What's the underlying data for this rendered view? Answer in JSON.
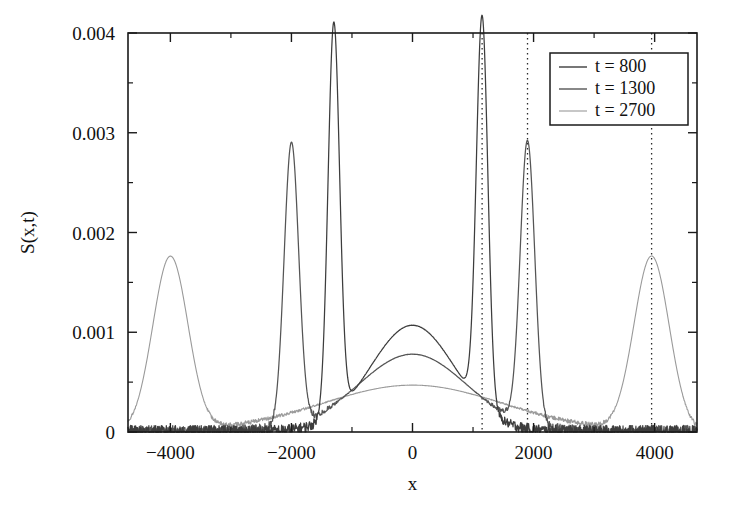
{
  "figure": {
    "xlabel": "x",
    "ylabel": "S(x,t)"
  },
  "axes": {
    "x_ticklabels": [
      "-4000",
      "-2000",
      "0",
      "2000",
      "4000"
    ],
    "y_ticklabels": [
      "0",
      "0.001",
      "0.002",
      "0.003",
      "0.004"
    ]
  },
  "legend": {
    "items": [
      {
        "label": "t = 800",
        "color": "#3d3d3d"
      },
      {
        "label": "t = 1300",
        "color": "#555555"
      },
      {
        "label": "t = 2700",
        "color": "#9a9a9a"
      }
    ]
  },
  "chart_data": {
    "type": "line",
    "title": "",
    "xlabel": "x",
    "ylabel": "S(x,t)",
    "xlim": [
      -4700,
      4700
    ],
    "ylim": [
      0,
      0.004
    ],
    "xticks": [
      -4000,
      -2000,
      0,
      2000,
      4000
    ],
    "yticks": [
      0,
      0.001,
      0.002,
      0.003,
      0.004
    ],
    "grid": false,
    "legend_position": "upper-right",
    "annotations": [
      {
        "type": "vline",
        "x": 1150,
        "style": "dotted",
        "note": "t = 800 ballistic peak position"
      },
      {
        "type": "vline",
        "x": 1900,
        "style": "dotted",
        "note": "t = 1300 ballistic peak position"
      },
      {
        "type": "vline",
        "x": 3950,
        "style": "dotted",
        "note": "t = 2700 ballistic peak position"
      }
    ],
    "series": [
      {
        "name": "t = 800",
        "color": "#3d3d3d",
        "noise_amplitude": 6e-05,
        "peaks": [
          {
            "center": -1300,
            "height": 0.00392,
            "width": 95,
            "kind": "ballistic"
          },
          {
            "center": 1150,
            "height": 0.0039,
            "width": 95,
            "kind": "ballistic"
          },
          {
            "center": 0,
            "height": 0.00107,
            "width": 700,
            "kind": "diffusive"
          }
        ]
      },
      {
        "name": "t = 1300",
        "color": "#555555",
        "noise_amplitude": 6e-05,
        "peaks": [
          {
            "center": -2000,
            "height": 0.00284,
            "width": 120,
            "kind": "ballistic"
          },
          {
            "center": 1900,
            "height": 0.00284,
            "width": 120,
            "kind": "ballistic"
          },
          {
            "center": 0,
            "height": 0.00078,
            "width": 900,
            "kind": "diffusive"
          }
        ]
      },
      {
        "name": "t = 2700",
        "color": "#9a9a9a",
        "noise_amplitude": 3e-05,
        "peaks": [
          {
            "center": -4000,
            "height": 0.00175,
            "width": 290,
            "kind": "ballistic"
          },
          {
            "center": 3950,
            "height": 0.00175,
            "width": 290,
            "kind": "ballistic"
          },
          {
            "center": 0,
            "height": 0.00047,
            "width": 1500,
            "kind": "diffusive"
          }
        ]
      }
    ]
  }
}
